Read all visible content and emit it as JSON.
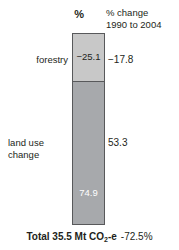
{
  "headers": {
    "value_column": "%",
    "change_column_line1": "% change",
    "change_column_line2": "1990 to 2004"
  },
  "rows": [
    {
      "label": "forestry",
      "value_label": "−25.1",
      "change_label": "−17.8"
    },
    {
      "label_line1": "land use",
      "label_line2": "change",
      "value_label": "74.9",
      "change_label": "53.3"
    }
  ],
  "footer": {
    "total_prefix": "Total 35.5 Mt CO",
    "total_sub": "2",
    "total_suffix": "-e",
    "total_change": "-72.5%"
  },
  "colors": {
    "forestry_fill": "#c8c8c8",
    "landuse_fill": "#a7a9ac",
    "outline": "#58595b",
    "text": "#231f20",
    "inverse_text": "#ffffff"
  },
  "chart_data": {
    "type": "bar",
    "title": "",
    "subtitle": "",
    "orientation": "vertical-stacked",
    "categories": [
      "forestry",
      "land use change"
    ],
    "series": [
      {
        "name": "%",
        "values": [
          -25.1,
          74.9
        ]
      },
      {
        "name": "% change 1990 to 2004",
        "values": [
          -17.8,
          53.3
        ]
      }
    ],
    "xlabel": "",
    "ylabel": "%",
    "legend": false,
    "grid": false,
    "annotations": [
      "Total 35.5 Mt CO2-e",
      "-72.5%"
    ],
    "totals": {
      "label": "Total 35.5 Mt CO2-e",
      "value": 35.5,
      "unit": "Mt CO2-e",
      "change_percent": -72.5
    }
  }
}
